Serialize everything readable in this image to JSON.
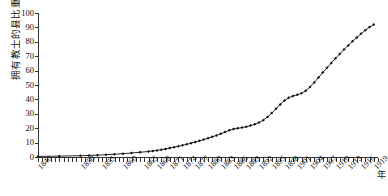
{
  "chart_data": {
    "type": "line",
    "title": "",
    "xlabel": "年",
    "ylabel": "拥有教士的县比重",
    "ylim": [
      0,
      100
    ],
    "xlim": [
      1840,
      1920
    ],
    "grid": false,
    "legend": null,
    "marker": "diamond",
    "marker_color": "#111111",
    "line_color": "#111111",
    "y_ticks": [
      0,
      10,
      20,
      30,
      40,
      50,
      60,
      70,
      80,
      90,
      100
    ],
    "x_tick_labels": [
      "1840",
      "1850",
      "1855",
      "1860",
      "1865",
      "1868",
      "1871",
      "1874",
      "1877",
      "1880",
      "1883",
      "1886",
      "1889",
      "1892",
      "1895",
      "1898",
      "1901",
      "1904",
      "1907",
      "1910",
      "1913",
      "1916",
      "1919"
    ],
    "x": [
      1840,
      1845,
      1850,
      1852,
      1854,
      1856,
      1858,
      1860,
      1862,
      1864,
      1866,
      1867,
      1868,
      1869,
      1870,
      1871,
      1872,
      1873,
      1874,
      1875,
      1876,
      1877,
      1878,
      1879,
      1880,
      1881,
      1882,
      1883,
      1884,
      1885,
      1886,
      1887,
      1888,
      1889,
      1890,
      1891,
      1892,
      1893,
      1894,
      1895,
      1896,
      1897,
      1898,
      1899,
      1900,
      1901,
      1902,
      1903,
      1904,
      1905,
      1906,
      1907,
      1908,
      1909,
      1910,
      1911,
      1912,
      1913,
      1914,
      1915,
      1916,
      1917,
      1918,
      1919
    ],
    "values": [
      0.4,
      0.6,
      0.9,
      1.1,
      1.3,
      1.6,
      1.9,
      2.3,
      2.8,
      3.3,
      3.8,
      4.2,
      4.6,
      5.1,
      5.6,
      6.2,
      6.8,
      7.4,
      8.1,
      8.8,
      9.6,
      10.4,
      11.2,
      12.1,
      13.0,
      14.0,
      15.0,
      16.1,
      17.3,
      18.5,
      19.4,
      19.9,
      20.4,
      21.0,
      21.8,
      22.7,
      23.9,
      25.6,
      27.8,
      30.5,
      33.5,
      36.5,
      39.2,
      41.2,
      42.4,
      43.2,
      44.2,
      46.0,
      48.6,
      51.8,
      55.2,
      58.6,
      62.0,
      65.3,
      68.5,
      71.6,
      74.6,
      77.5,
      80.3,
      83.0,
      85.6,
      88.0,
      90.2,
      92.0
    ]
  }
}
